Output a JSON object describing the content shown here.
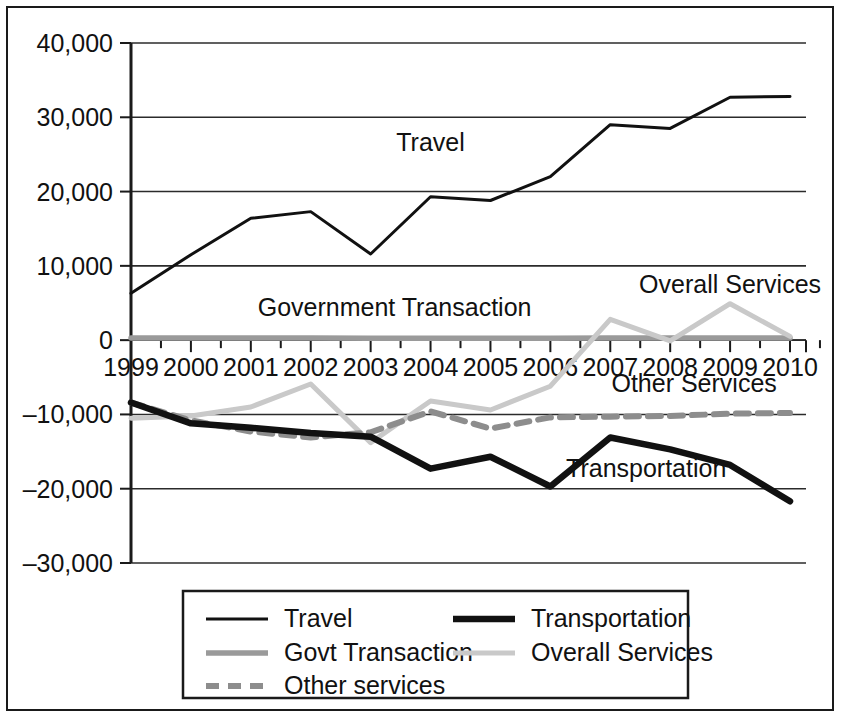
{
  "chart_data": {
    "type": "line",
    "title": "",
    "subtitle": "",
    "xlabel": "",
    "ylabel": "",
    "categories": [
      "1999",
      "2000",
      "2001",
      "2002",
      "2003",
      "2004",
      "2005",
      "2006",
      "2007",
      "2008",
      "2009",
      "2010"
    ],
    "ylim": [
      -30000,
      40000
    ],
    "ytick_values": [
      40000,
      30000,
      20000,
      10000,
      0,
      -10000,
      -20000,
      -30000
    ],
    "ytick_labels": [
      "40,000",
      "30,000",
      "20,000",
      "10,000",
      "0",
      "–10,000",
      "–20,000",
      "–30,000"
    ],
    "grid": true,
    "legend_position": "bottom",
    "series": [
      {
        "name": "Travel",
        "style": "thin-solid-black",
        "color": "#111111",
        "values": [
          6300,
          11500,
          16400,
          17300,
          11600,
          19300,
          18800,
          22000,
          29000,
          28500,
          32700,
          32800
        ]
      },
      {
        "name": "Transportation",
        "style": "thick-solid-black",
        "color": "#111111",
        "values": [
          -8400,
          -11200,
          -11800,
          -12500,
          -13000,
          -17300,
          -15700,
          -19700,
          -13100,
          -14700,
          -16800,
          -21700
        ]
      },
      {
        "name": "Govt Transaction",
        "style": "medium-solid-gray",
        "color": "#9a9a9a",
        "values": [
          300,
          300,
          300,
          300,
          250,
          250,
          250,
          250,
          300,
          300,
          300,
          300
        ]
      },
      {
        "name": "Overall Services",
        "style": "medium-solid-lightgray",
        "color": "#c9c9c9",
        "values": [
          -10500,
          -10200,
          -9000,
          -5900,
          -13800,
          -8200,
          -9400,
          -6200,
          2800,
          -100,
          4900,
          500
        ]
      },
      {
        "name": "Other services",
        "style": "dashed-gray",
        "color": "#8d8d8d",
        "values": [
          -8400,
          -10800,
          -12300,
          -13100,
          -12400,
          -9600,
          -11900,
          -10400,
          -10300,
          -10200,
          -9900,
          -9800
        ]
      }
    ],
    "annotations": [
      {
        "text": "Travel",
        "x": 2004,
        "y": 25500
      },
      {
        "text": "Overall Services",
        "x": 2009,
        "y": 6400
      },
      {
        "text": "Government Transaction",
        "x": 2003.4,
        "y": 3200
      },
      {
        "text": "Other Services",
        "x": 2008.4,
        "y": -7000
      },
      {
        "text": "Transportation",
        "x": 2007.6,
        "y": -18400
      }
    ],
    "legend": [
      {
        "label": "Travel",
        "style": "thin-solid-black",
        "color": "#111111"
      },
      {
        "label": "Transportation",
        "style": "thick-solid-black",
        "color": "#111111"
      },
      {
        "label": "Govt Transaction",
        "style": "medium-solid-gray",
        "color": "#9a9a9a"
      },
      {
        "label": "Overall Services",
        "style": "medium-solid-lightgray",
        "color": "#c9c9c9"
      },
      {
        "label": "Other services",
        "style": "dashed-gray",
        "color": "#8d8d8d"
      }
    ]
  }
}
